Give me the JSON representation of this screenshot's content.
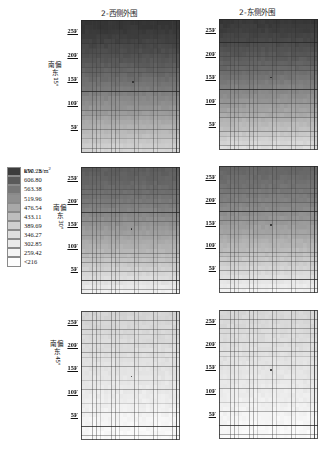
{
  "columns": [
    {
      "title": "2-西侧外围"
    },
    {
      "title": "2-东侧外围"
    }
  ],
  "rows": [
    {
      "label_cjk": "南偏东",
      "label_deg": "15°"
    },
    {
      "label_cjk": "南偏东",
      "label_deg": "30°"
    },
    {
      "label_cjk": "南偏东",
      "label_deg": "45°"
    }
  ],
  "axis": {
    "tick_labels": [
      "25F",
      "20F",
      "15F",
      "10F",
      "5F"
    ]
  },
  "legend": {
    "unit_label": "kW · h/m",
    "unit_exponent": "2",
    "entries": [
      {
        "value": "650.23",
        "color": "#3c3c3c"
      },
      {
        "value": "606.80",
        "color": "#5a5a5a"
      },
      {
        "value": "563.38",
        "color": "#777777"
      },
      {
        "value": "519.96",
        "color": "#8f8f8f"
      },
      {
        "value": "476.54",
        "color": "#a8a8a8"
      },
      {
        "value": "433.11",
        "color": "#bdbdbd"
      },
      {
        "value": "389.69",
        "color": "#cfcfcf"
      },
      {
        "value": "346.27",
        "color": "#dedede"
      },
      {
        "value": "302.85",
        "color": "#eaeaea"
      },
      {
        "value": "259.42",
        "color": "#f4f4f4"
      },
      {
        "value": "<216",
        "color": "#fdfdfd"
      }
    ]
  },
  "chart_data": {
    "type": "heatmap",
    "title": "",
    "xlabel": "",
    "ylabel": "",
    "unit": "kW · h/m2",
    "grid": true,
    "legend_position": "left-middle",
    "colormap": "grayscale-reversed",
    "value_scale": [
      216,
      650.23
    ],
    "facet_columns": [
      "2-西侧外围",
      "2-东侧外围"
    ],
    "facet_rows": [
      "南偏东 15°",
      "南偏东 30°",
      "南偏东 45°"
    ],
    "y_tick_labels": [
      "25F",
      "20F",
      "15F",
      "10F",
      "5F"
    ],
    "y_tick_values": [
      25,
      20,
      15,
      10,
      5
    ],
    "grid_cols": 26,
    "grid_rows": 28,
    "panels": [
      {
        "row": "南偏东 15°",
        "col": "2-西侧外围",
        "top_value": 650,
        "bottom_value": 300,
        "marker": {
          "x_frac": 0.52,
          "y_frac": 0.46
        },
        "description": "Strong vertical gradient, dark (≈650) at top floors fading to light (≈300) at base"
      },
      {
        "row": "南偏东 15°",
        "col": "2-东侧外围",
        "top_value": 640,
        "bottom_value": 280,
        "marker": {
          "x_frac": 0.52,
          "y_frac": 0.44
        },
        "description": "Dark at upper floors, lighter low-rise band near base"
      },
      {
        "row": "南偏东 30°",
        "col": "2-西侧外围",
        "top_value": 560,
        "bottom_value": 240,
        "marker": {
          "x_frac": 0.5,
          "y_frac": 0.48
        },
        "description": "Moderate gradient, mid-gray top to near-white bottom"
      },
      {
        "row": "南偏东 30°",
        "col": "2-东侧外围",
        "top_value": 540,
        "bottom_value": 235,
        "marker": {
          "x_frac": 0.52,
          "y_frac": 0.46
        },
        "description": "Moderate gradient, mid-gray top to near-white bottom"
      },
      {
        "row": "南偏东 45°",
        "col": "2-西侧外围",
        "top_value": 300,
        "bottom_value": 216,
        "marker": {
          "x_frac": 0.5,
          "y_frac": 0.5
        },
        "description": "Nearly uniform pale field, values at or below lowest legend bin"
      },
      {
        "row": "南偏东 45°",
        "col": "2-东侧外围",
        "top_value": 295,
        "bottom_value": 216,
        "marker": {
          "x_frac": 0.52,
          "y_frac": 0.46
        },
        "description": "Nearly uniform pale field, values at or below lowest legend bin"
      }
    ]
  },
  "layout": {
    "panel_geometry": [
      {
        "x": 81,
        "y": 20,
        "w": 99,
        "h": 133
      },
      {
        "x": 219,
        "y": 19,
        "w": 99,
        "h": 131
      },
      {
        "x": 81,
        "y": 167,
        "w": 99,
        "h": 127
      },
      {
        "x": 219,
        "y": 166,
        "w": 99,
        "h": 127
      },
      {
        "x": 81,
        "y": 311,
        "w": 99,
        "h": 129
      },
      {
        "x": 219,
        "y": 310,
        "w": 99,
        "h": 129
      }
    ]
  }
}
